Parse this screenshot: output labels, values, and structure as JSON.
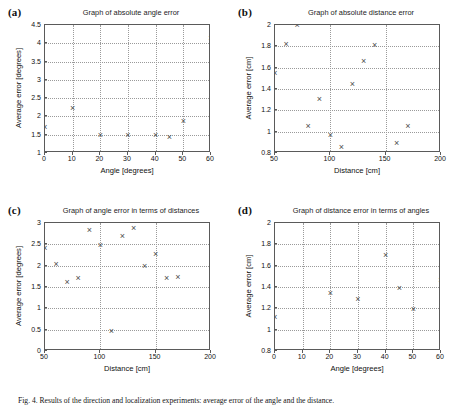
{
  "figure": {
    "caption": "Fig. 4. Results of the direction and localization experiments: average error of the angle and the distance.",
    "panels": [
      {
        "tag": "(a)",
        "key": "a"
      },
      {
        "tag": "(b)",
        "key": "b"
      },
      {
        "tag": "(c)",
        "key": "c"
      },
      {
        "tag": "(d)",
        "key": "d"
      }
    ]
  },
  "chart_data": [
    {
      "id": "a",
      "panel_label": "(a)",
      "type": "scatter",
      "title": "Graph of absolute angle error",
      "xlabel": "Angle [degrees]",
      "ylabel": "Average error [degrees]",
      "xlim": [
        0,
        60
      ],
      "ylim": [
        1,
        4.5
      ],
      "xticks": [
        0,
        10,
        20,
        30,
        40,
        50,
        60
      ],
      "xticklabels": [
        "0",
        "10",
        "20",
        "30",
        "40",
        "50",
        "60"
      ],
      "yticks": [
        1,
        1.5,
        2,
        2.5,
        3,
        3.5,
        4,
        4.5
      ],
      "yticklabels": [
        "1",
        "1.5",
        "2",
        "2.5",
        "3",
        "3.5",
        "4",
        "4.5"
      ],
      "grid": true,
      "marker": "x",
      "marker_color": "#4d4d4d",
      "points": [
        {
          "x": 0,
          "y": 1.7
        },
        {
          "x": 10,
          "y": 2.22
        },
        {
          "x": 20,
          "y": 1.47
        },
        {
          "x": 30,
          "y": 1.47
        },
        {
          "x": 40,
          "y": 1.47
        },
        {
          "x": 45,
          "y": 1.43
        },
        {
          "x": 50,
          "y": 1.87
        },
        {
          "x": 60,
          "y": 4.13
        }
      ]
    },
    {
      "id": "b",
      "panel_label": "(b)",
      "type": "scatter",
      "title": "Graph of absolute distance error",
      "xlabel": "Distance [cm]",
      "ylabel": "Average error [cm]",
      "xlim": [
        50,
        200
      ],
      "ylim": [
        0.8,
        2.0
      ],
      "xticks": [
        50,
        100,
        150,
        200
      ],
      "xticklabels": [
        "50",
        "100",
        "150",
        "200"
      ],
      "yticks": [
        0.8,
        1.0,
        1.2,
        1.4,
        1.6,
        1.8,
        2.0
      ],
      "yticklabels": [
        "0.8",
        "1",
        "1.2",
        "1.4",
        "1.6",
        "1.8",
        "2"
      ],
      "grid": true,
      "marker": "x",
      "marker_color": "#4d4d4d",
      "points": [
        {
          "x": 50,
          "y": 1.55
        },
        {
          "x": 60,
          "y": 1.82
        },
        {
          "x": 70,
          "y": 2.0
        },
        {
          "x": 80,
          "y": 1.05
        },
        {
          "x": 90,
          "y": 1.3
        },
        {
          "x": 100,
          "y": 0.96
        },
        {
          "x": 110,
          "y": 0.85
        },
        {
          "x": 120,
          "y": 1.44
        },
        {
          "x": 130,
          "y": 1.66
        },
        {
          "x": 140,
          "y": 1.81
        },
        {
          "x": 150,
          "y": 0.74
        },
        {
          "x": 160,
          "y": 0.89
        },
        {
          "x": 170,
          "y": 1.05
        }
      ]
    },
    {
      "id": "c",
      "panel_label": "(c)",
      "type": "scatter",
      "title": "Graph of angle error in terms of distances",
      "xlabel": "Distance [cm]",
      "ylabel": "Average error [degrees]",
      "xlim": [
        50,
        200
      ],
      "ylim": [
        0,
        3
      ],
      "xticks": [
        50,
        100,
        150,
        200
      ],
      "xticklabels": [
        "50",
        "100",
        "150",
        "200"
      ],
      "yticks": [
        0,
        0.5,
        1,
        1.5,
        2,
        2.5,
        3
      ],
      "yticklabels": [
        "0",
        "0.5",
        "1",
        "1.5",
        "2",
        "2.5",
        "3"
      ],
      "grid": true,
      "marker": "x",
      "marker_color": "#4d4d4d",
      "points": [
        {
          "x": 50,
          "y": 2.41
        },
        {
          "x": 60,
          "y": 2.03
        },
        {
          "x": 70,
          "y": 1.6
        },
        {
          "x": 80,
          "y": 1.69
        },
        {
          "x": 90,
          "y": 2.82
        },
        {
          "x": 100,
          "y": 2.47
        },
        {
          "x": 110,
          "y": 0.46
        },
        {
          "x": 120,
          "y": 2.69
        },
        {
          "x": 130,
          "y": 2.88
        },
        {
          "x": 140,
          "y": 1.99
        },
        {
          "x": 150,
          "y": 2.27
        },
        {
          "x": 160,
          "y": 1.69
        },
        {
          "x": 170,
          "y": 1.72
        }
      ]
    },
    {
      "id": "d",
      "panel_label": "(d)",
      "type": "scatter",
      "title": "Graph of distance error in terms of angles",
      "xlabel": "Angle [degrees]",
      "ylabel": "Average error [cm]",
      "xlim": [
        0,
        60
      ],
      "ylim": [
        0.8,
        2.0
      ],
      "xticks": [
        0,
        10,
        20,
        30,
        40,
        50,
        60
      ],
      "xticklabels": [
        "0",
        "10",
        "20",
        "30",
        "40",
        "50",
        "60"
      ],
      "yticks": [
        0.8,
        1.0,
        1.2,
        1.4,
        1.6,
        1.8,
        2.0
      ],
      "yticklabels": [
        "0.8",
        "1",
        "1.2",
        "1.4",
        "1.6",
        "1.8",
        "2"
      ],
      "grid": true,
      "marker": "x",
      "marker_color": "#4d4d4d",
      "points": [
        {
          "x": 0,
          "y": 1.11
        },
        {
          "x": 10,
          "y": 0.76
        },
        {
          "x": 20,
          "y": 1.34
        },
        {
          "x": 30,
          "y": 1.28
        },
        {
          "x": 40,
          "y": 1.7
        },
        {
          "x": 45,
          "y": 1.39
        },
        {
          "x": 50,
          "y": 1.19
        },
        {
          "x": 60,
          "y": 1.46
        }
      ]
    }
  ]
}
